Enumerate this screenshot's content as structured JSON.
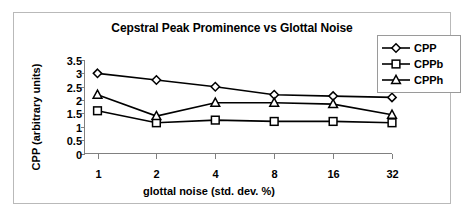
{
  "chart_data": {
    "type": "line",
    "title": "Cepstral Peak Prominence vs Glottal Noise",
    "xlabel": "glottal noise (std. dev.  %)",
    "ylabel": "CPP (arbitrary units)",
    "categories": [
      "1",
      "2",
      "4",
      "8",
      "16",
      "32"
    ],
    "ylim": [
      0,
      3.5
    ],
    "yticks": [
      "3.5",
      "3",
      "2.5",
      "2",
      "1.5",
      "1",
      "0.5",
      "0"
    ],
    "ytick_values": [
      3.5,
      3,
      2.5,
      2,
      1.5,
      1,
      0.5,
      0
    ],
    "grid": false,
    "legend_position": "top-right",
    "series": [
      {
        "name": "CPP",
        "marker": "diamond",
        "values": [
          3.0,
          2.75,
          2.5,
          2.2,
          2.15,
          2.1
        ]
      },
      {
        "name": "CPPb",
        "marker": "square",
        "values": [
          1.6,
          1.15,
          1.25,
          1.2,
          1.2,
          1.15
        ]
      },
      {
        "name": "CPPh",
        "marker": "triangle",
        "values": [
          2.2,
          1.4,
          1.9,
          1.9,
          1.85,
          1.45
        ]
      }
    ]
  },
  "colors": {
    "line": "#000000",
    "marker_fill": "#ffffff",
    "axis": "#808080",
    "frame": "#b9b9b9",
    "legend_border": "#9a9a9a"
  }
}
